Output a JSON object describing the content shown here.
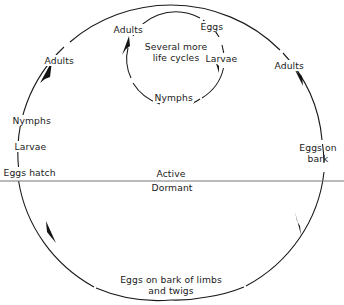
{
  "diagram": {
    "background_color": "#ffffff",
    "line_color": "#1a1a1a",
    "divider_color": "#777777",
    "outer_cycle": {
      "name": "annual cycle",
      "labels": {
        "eggs_hatch": "Eggs hatch",
        "larvae": "Larvae",
        "nymphs": "Nymphs",
        "adults_left": "Adults",
        "adults_right": "Adults",
        "eggs_on_bark_line1": "Eggs on",
        "eggs_on_bark_line2": "bark",
        "overwinter_line1": "Eggs on bark of limbs",
        "overwinter_line2": "and twigs"
      }
    },
    "inner_cycle": {
      "name": "repeated summer generations",
      "labels": {
        "adults": "Adults",
        "eggs": "Eggs",
        "larvae": "Larvae",
        "nymphs": "Nymphs",
        "center_line1": "Several more",
        "center_line2": "life cycles"
      }
    },
    "divider": {
      "above_label": "Active",
      "below_label": "Dormant"
    }
  }
}
